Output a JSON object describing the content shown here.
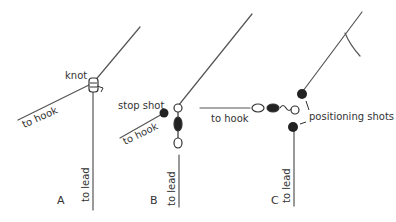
{
  "figure": {
    "panels": [
      {
        "id": "A",
        "label": "A",
        "labels": {
          "knot": "knot",
          "hook": "to hook",
          "lead": "to lead"
        }
      },
      {
        "id": "B",
        "label": "B",
        "labels": {
          "stop": "stop shot",
          "hook": "to hook",
          "lead": "to lead"
        }
      },
      {
        "id": "C",
        "label": "C",
        "labels": {
          "positioning": "positioning shots",
          "hook": "to hook",
          "lead": "to lead"
        }
      }
    ]
  }
}
